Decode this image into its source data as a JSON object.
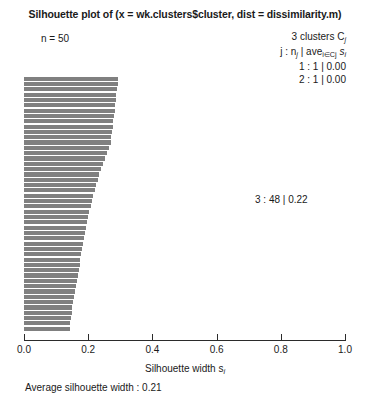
{
  "title": "Silhouette plot of (x = wk.clusters$cluster, dist = dissimilarity.m)",
  "n_label": "n = 50",
  "legend": {
    "header": "3 clusters C",
    "header_sub": "j",
    "formula_prefix": "j : n",
    "formula_sub1": "j",
    "formula_mid": "| ave",
    "formula_sub2": "i∈Cj",
    "formula_suffix": "s",
    "formula_sub3": "i",
    "rows": [
      "1 :  1 | 0.00",
      "2 :  1 | 0.00"
    ],
    "cluster3": "3 : 48 | 0.22"
  },
  "axis": {
    "label_prefix": "Silhouette width s",
    "label_sub": "i",
    "ticks": [
      "0.0",
      "0.2",
      "0.4",
      "0.6",
      "0.8",
      "1.0"
    ],
    "tick_values": [
      0.0,
      0.2,
      0.4,
      0.6,
      0.8,
      1.0
    ],
    "xlim": [
      0.0,
      1.0
    ]
  },
  "footer": "Average silhouette width : 0.21",
  "colors": {
    "bar": "#808080",
    "axis": "#2b2b2b",
    "text": "#1a1a1a",
    "background": "#ffffff"
  },
  "chart_data": {
    "type": "bar",
    "orientation": "horizontal",
    "title": "Silhouette plot of (x = wk.clusters$cluster, dist = dissimilarity.m)",
    "xlabel": "Silhouette width s_i",
    "ylabel": "",
    "xlim": [
      0.0,
      1.0
    ],
    "grid": false,
    "n_observations": 50,
    "n_clusters": 3,
    "average_silhouette_width": 0.21,
    "clusters": [
      {
        "id": 1,
        "size": 1,
        "average_silhouette": 0.0
      },
      {
        "id": 2,
        "size": 1,
        "average_silhouette": 0.0
      },
      {
        "id": 3,
        "size": 48,
        "average_silhouette": 0.22
      }
    ],
    "categories": [
      "obs1",
      "obs2",
      "obs3",
      "obs4",
      "obs5",
      "obs6",
      "obs7",
      "obs8",
      "obs9",
      "obs10",
      "obs11",
      "obs12",
      "obs13",
      "obs14",
      "obs15",
      "obs16",
      "obs17",
      "obs18",
      "obs19",
      "obs20",
      "obs21",
      "obs22",
      "obs23",
      "obs24",
      "obs25",
      "obs26",
      "obs27",
      "obs28",
      "obs29",
      "obs30",
      "obs31",
      "obs32",
      "obs33",
      "obs34",
      "obs35",
      "obs36",
      "obs37",
      "obs38",
      "obs39",
      "obs40",
      "obs41",
      "obs42",
      "obs43",
      "obs44",
      "obs45",
      "obs46",
      "obs47",
      "obs48",
      "obs49",
      "obs50"
    ],
    "values": [
      0.0,
      0.0,
      0.293,
      0.292,
      0.29,
      0.288,
      0.286,
      0.284,
      0.282,
      0.28,
      0.278,
      0.276,
      0.274,
      0.272,
      0.27,
      0.264,
      0.258,
      0.252,
      0.246,
      0.24,
      0.235,
      0.23,
      0.225,
      0.22,
      0.216,
      0.212,
      0.208,
      0.204,
      0.2,
      0.197,
      0.194,
      0.191,
      0.188,
      0.185,
      0.182,
      0.179,
      0.176,
      0.173,
      0.17,
      0.167,
      0.164,
      0.161,
      0.158,
      0.155,
      0.152,
      0.15,
      0.148,
      0.146,
      0.144,
      0.142
    ]
  }
}
